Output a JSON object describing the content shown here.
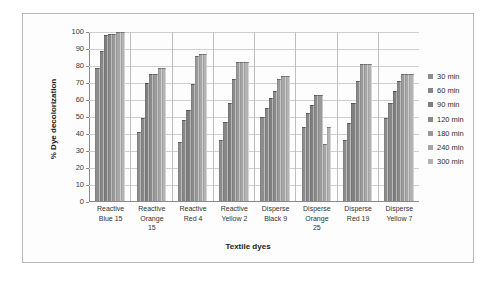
{
  "chart_data": {
    "type": "bar",
    "title": "",
    "xlabel": "Textile dyes",
    "ylabel": "% Dye decolorization",
    "ylim": [
      0,
      100
    ],
    "ytick_step": 10,
    "yticks": [
      100,
      90,
      80,
      70,
      60,
      50,
      40,
      30,
      20,
      10,
      0
    ],
    "grid": "horizontal",
    "legend_position": "right",
    "categories": [
      "Reactive Blue 15",
      "Reactive Orange 15",
      "Reactive Red 4",
      "Reactive Yellow 2",
      "Disperse Black 9",
      "Disperse Orange 25",
      "Disperse Red 19",
      "Disperse Yellow 7"
    ],
    "category_lines": [
      [
        "Reactive",
        "Blue 15"
      ],
      [
        "Reactive",
        "Orange",
        "15"
      ],
      [
        "Reactive",
        "Red 4"
      ],
      [
        "Reactive",
        "Yellow 2"
      ],
      [
        "Disperse",
        "Black 9"
      ],
      [
        "Disperse",
        "Orange",
        "25"
      ],
      [
        "Disperse",
        "Red 19"
      ],
      [
        "Disperse",
        "Yellow 7"
      ]
    ],
    "series": [
      {
        "name": "30 min",
        "color": "#8c8c8c",
        "values": [
          79,
          41,
          35,
          36,
          50,
          44,
          36,
          49
        ]
      },
      {
        "name": "60 min",
        "color": "#878787",
        "values": [
          89,
          49,
          48,
          47,
          55,
          52,
          46,
          58
        ]
      },
      {
        "name": "90 min",
        "color": "#7f7f7f",
        "values": [
          98,
          70,
          54,
          58,
          61,
          57,
          58,
          65
        ]
      },
      {
        "name": "120 min",
        "color": "#8a8a8a",
        "values": [
          99,
          75,
          69,
          72,
          65,
          63,
          71,
          71
        ]
      },
      {
        "name": "180 min",
        "color": "#9a9a9a",
        "values": [
          99,
          75,
          86,
          82,
          72,
          63,
          81,
          75
        ]
      },
      {
        "name": "240 min",
        "color": "#a6a6a6",
        "values": [
          100,
          79,
          87,
          82,
          74,
          34,
          81,
          75
        ]
      },
      {
        "name": "300 min",
        "color": "#b2b2b2",
        "values": [
          100,
          79,
          87,
          82,
          74,
          44,
          81,
          75
        ]
      }
    ]
  },
  "legend": {
    "items": [
      "30 min",
      "60 min",
      "90 min",
      "120 min",
      "180 min",
      "240 min",
      "300 min"
    ]
  }
}
